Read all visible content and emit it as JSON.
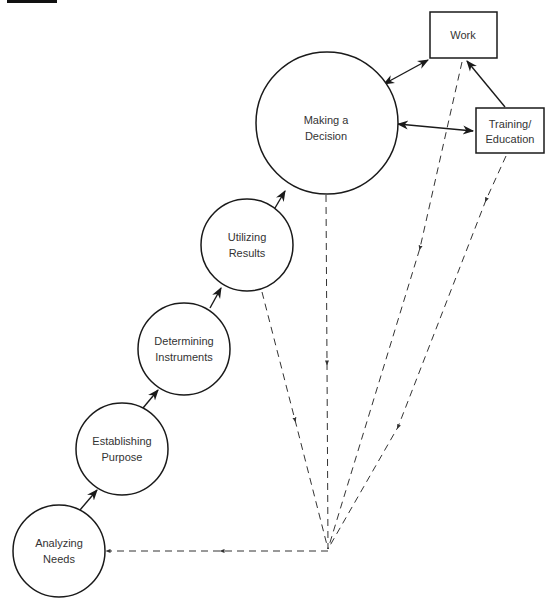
{
  "diagram": {
    "type": "process-flow",
    "colors": {
      "stroke": "#1a1a1a",
      "text": "#333333",
      "background": "#ffffff"
    },
    "circles": [
      {
        "id": "analyzing-needs",
        "line1": "Analyzing",
        "line2": "Needs",
        "cx": 59,
        "cy": 551,
        "r": 46
      },
      {
        "id": "establishing-purpose",
        "line1": "Establishing",
        "line2": "Purpose",
        "cx": 122,
        "cy": 449,
        "r": 46
      },
      {
        "id": "determining-instruments",
        "line1": "Determining",
        "line2": "Instruments",
        "cx": 184,
        "cy": 349,
        "r": 46
      },
      {
        "id": "utilizing-results",
        "line1": "Utilizing",
        "line2": "Results",
        "cx": 247,
        "cy": 245,
        "r": 46
      },
      {
        "id": "making-a-decision",
        "line1": "Making a",
        "line2": "Decision",
        "cx": 327,
        "cy": 123,
        "r": 71
      }
    ],
    "boxes": [
      {
        "id": "work",
        "line1": "Work",
        "line2": "",
        "x": 430,
        "y": 12,
        "w": 67,
        "h": 46
      },
      {
        "id": "training-education",
        "line1": "Training/",
        "line2": "Education",
        "x": 476,
        "y": 108,
        "w": 68,
        "h": 45
      }
    ],
    "convergence_point": {
      "x": 328,
      "y": 549
    }
  }
}
